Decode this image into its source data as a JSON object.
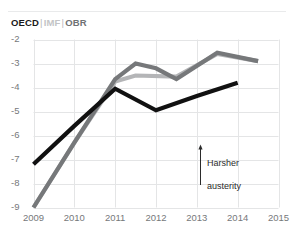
{
  "legend": {
    "items": [
      {
        "label": "OECD",
        "color": "#1a1a1a"
      },
      {
        "label": "IMF",
        "color": "#c3c4c6"
      },
      {
        "label": "OBR",
        "color": "#6f7173"
      }
    ],
    "separator": "|"
  },
  "annotation": {
    "arrow": "↑",
    "line1": "Harsher",
    "line2": "austerity",
    "text": "Harsher austerity"
  },
  "chart_data": {
    "type": "line",
    "title": "",
    "subtitle": "",
    "xlabel": "",
    "ylabel": "",
    "xlim": [
      2009,
      2015
    ],
    "ylim": [
      -9,
      -2
    ],
    "grid": true,
    "legend_position": "top-left",
    "x_ticks": [
      "2009",
      "2010",
      "2011",
      "2012",
      "2013",
      "2014",
      "2015"
    ],
    "y_ticks": [
      "-2",
      "-3",
      "-4",
      "-5",
      "-6",
      "-7",
      "-8",
      "-9"
    ],
    "series": [
      {
        "name": "OECD",
        "color": "#111111",
        "x": [
          2009,
          2010,
          2011,
          2012,
          2013,
          2014
        ],
        "values": [
          -7.2,
          -5.6,
          -4.05,
          -4.95,
          -4.35,
          -3.8
        ]
      },
      {
        "name": "IMF",
        "color": "#b4b5b7",
        "x": [
          2009,
          2010,
          2011,
          2011.5,
          2012.5,
          2013.5,
          2014.5
        ],
        "values": [
          -9.0,
          -6.3,
          -3.75,
          -3.5,
          -3.55,
          -2.6,
          -2.9
        ]
      },
      {
        "name": "OBR",
        "color": "#76787a",
        "x": [
          2009,
          2010,
          2011,
          2011.5,
          2012,
          2012.5,
          2013.5,
          2014.5
        ],
        "values": [
          -9.0,
          -6.3,
          -3.65,
          -3.0,
          -3.2,
          -3.65,
          -2.55,
          -2.9
        ]
      }
    ]
  }
}
